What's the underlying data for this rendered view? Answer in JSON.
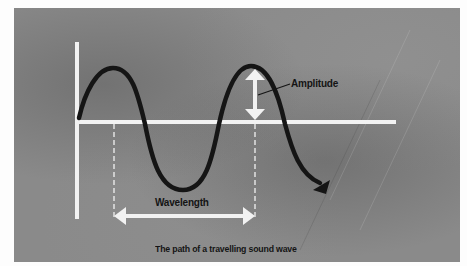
{
  "diagram": {
    "title": "The path of a travelling sound wave",
    "labels": {
      "amplitude": "Amplitude",
      "wavelength": "Wavelength",
      "caption": "The path of a travelling sound wave"
    },
    "elements": {
      "axes": [
        "vertical-axis",
        "horizontal-axis (rest line)"
      ],
      "wave": "sinusoidal curve, ~1.5 cycles, ending in arrowhead (direction of travel)",
      "amplitude_marker": "double-headed vertical arrow from crest to rest line",
      "wavelength_marker": "double-headed horizontal arrow between two dashed vertical guides (crest to crest)"
    },
    "colors": {
      "background": "#8a8a8a",
      "axes": "#f2f2f2",
      "wave": "#151515",
      "text": "#141414",
      "page": "#fdfdfd"
    }
  }
}
